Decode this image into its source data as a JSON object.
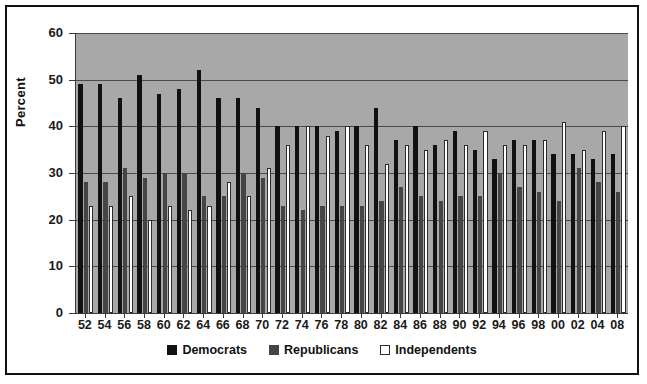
{
  "chart_data": {
    "type": "bar",
    "title": "",
    "xlabel": "",
    "ylabel": "Percent",
    "ylim": [
      0,
      60
    ],
    "ytick_values": [
      0,
      10,
      20,
      30,
      40,
      50,
      60
    ],
    "ytick_labels": [
      "0",
      "10",
      "20",
      "30",
      "40",
      "50",
      "60"
    ],
    "grid": true,
    "legend_position": "bottom",
    "categories": [
      "52",
      "54",
      "56",
      "58",
      "60",
      "62",
      "64",
      "66",
      "68",
      "70",
      "72",
      "74",
      "76",
      "78",
      "80",
      "82",
      "84",
      "86",
      "88",
      "90",
      "92",
      "94",
      "96",
      "98",
      "00",
      "02",
      "04",
      "08"
    ],
    "series": [
      {
        "name": "Democrats",
        "color": "#111111",
        "values": [
          49,
          49,
          46,
          51,
          47,
          48,
          52,
          46,
          46,
          44,
          40,
          40,
          40,
          39,
          40,
          44,
          37,
          40,
          36,
          39,
          35,
          33,
          37,
          37,
          34,
          34,
          33,
          34
        ]
      },
      {
        "name": "Republicans",
        "color": "#454545",
        "values": [
          28,
          28,
          31,
          29,
          30,
          30,
          25,
          25,
          30,
          29,
          23,
          22,
          23,
          23,
          23,
          24,
          27,
          25,
          24,
          25,
          25,
          30,
          27,
          26,
          24,
          31,
          28,
          26
        ]
      },
      {
        "name": "Independents",
        "color": "#ffffff",
        "values": [
          23,
          23,
          25,
          20,
          23,
          22,
          23,
          28,
          25,
          31,
          36,
          40,
          38,
          40,
          36,
          32,
          36,
          35,
          37,
          36,
          39,
          36,
          36,
          37,
          41,
          35,
          39,
          40
        ]
      }
    ]
  },
  "axes": {
    "y_title": "Percent"
  },
  "legend": {
    "items": [
      {
        "label": "Democrats",
        "swatch": "filled-black-square"
      },
      {
        "label": "Republicans",
        "swatch": "filled-gray-square"
      },
      {
        "label": "Independents",
        "swatch": "outlined-white-square"
      }
    ]
  },
  "colors": {
    "plot_background": "#a8a8a8",
    "page_background": "#ffffff",
    "frame_border": "#111111",
    "gridline": "#4a4a4a",
    "democrats": "#111111",
    "republicans": "#454545",
    "independents": "#ffffff"
  }
}
